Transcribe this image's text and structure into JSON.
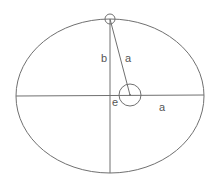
{
  "diagram": {
    "colors": {
      "stroke": "#707070",
      "label": "#555555",
      "background": "#ffffff"
    },
    "ellipse": {
      "cx": 110,
      "cy": 96,
      "rx": 94,
      "ry": 77
    },
    "focus": {
      "cx": 130,
      "cy": 95,
      "r": 11
    },
    "top_marker": {
      "cx": 110,
      "cy": 19,
      "r": 5
    },
    "labels": {
      "semi_minor": "b",
      "focal_radius": "a",
      "eccentricity": "e",
      "semi_major": "a"
    }
  }
}
